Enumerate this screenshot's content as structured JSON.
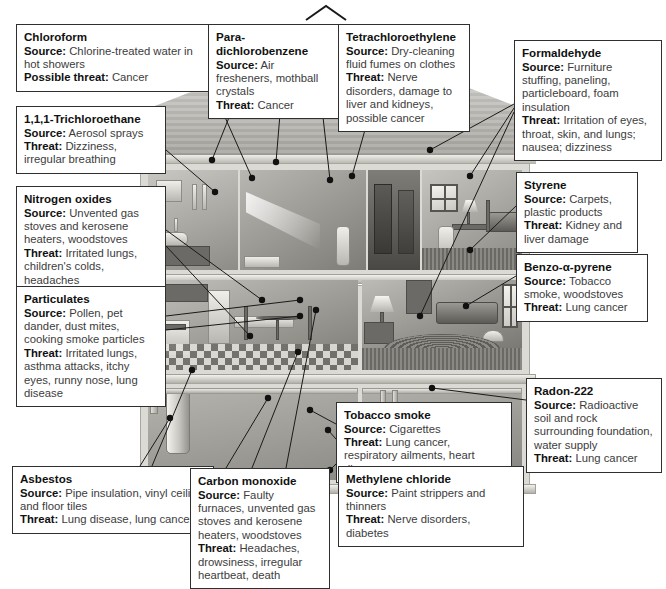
{
  "diagram": {
    "type": "cutaway-illustration",
    "labels": {
      "source": "Source:",
      "threat": "Threat:",
      "possible_threat": "Possible threat:"
    }
  },
  "pollutants": [
    {
      "id": "chloroform",
      "name": "Chloroform",
      "source_label": "Source:",
      "source": "Chlorine-treated water in hot showers",
      "threat_label": "Possible threat:",
      "threat": "Cancer"
    },
    {
      "id": "trichloroethane",
      "name": "1,1,1-Trichloroethane",
      "source_label": "Source:",
      "source": "Aerosol sprays",
      "threat_label": "Threat:",
      "threat": "Dizziness, irregular breathing"
    },
    {
      "id": "nitrogen-oxides",
      "name": "Nitrogen oxides",
      "source_label": "Source:",
      "source": "Unvented gas stoves and kerosene heaters, woodstoves",
      "threat_label": "Threat:",
      "threat": "Irritated lungs, children's colds, headaches"
    },
    {
      "id": "particulates",
      "name": "Particulates",
      "source_label": "Source:",
      "source": "Pollen, pet dander, dust mites, cooking smoke particles",
      "threat_label": "Threat:",
      "threat": "Irritated lungs, asthma attacks, itchy eyes, runny nose, lung disease"
    },
    {
      "id": "asbestos",
      "name": "Asbestos",
      "source_label": "Source:",
      "source": "Pipe insulation, vinyl ceiling and floor tiles",
      "threat_label": "Threat:",
      "threat": "Lung disease, lung cancer"
    },
    {
      "id": "para-dichlorobenzene",
      "name": "Para-dichlorobenzene",
      "source_label": "Source:",
      "source": "Air fresheners, mothball crystals",
      "threat_label": "Threat:",
      "threat": "Cancer"
    },
    {
      "id": "tetrachloroethylene",
      "name": "Tetrachloroethylene",
      "source_label": "Source:",
      "source": "Dry-cleaning fluid fumes on clothes",
      "threat_label": "Threat:",
      "threat": "Nerve disorders, damage to liver and kidneys, possible cancer"
    },
    {
      "id": "formaldehyde",
      "name": "Formaldehyde",
      "source_label": "Source:",
      "source": "Furniture stuffing, paneling, particleboard, foam insulation",
      "threat_label": "Threat:",
      "threat": "Irritation of eyes, throat, skin, and lungs; nausea; dizziness"
    },
    {
      "id": "styrene",
      "name": "Styrene",
      "source_label": "Source:",
      "source": "Carpets, plastic products",
      "threat_label": "Threat:",
      "threat": "Kidney and liver damage"
    },
    {
      "id": "benzo-a-pyrene",
      "name": "Benzo-α-pyrene",
      "source_label": "Source:",
      "source": "Tobacco smoke, woodstoves",
      "threat_label": "Threat:",
      "threat": "Lung cancer"
    },
    {
      "id": "radon-222",
      "name": "Radon-222",
      "source_label": "Source:",
      "source": "Radioactive soil and rock surrounding foundation, water supply",
      "threat_label": "Threat:",
      "threat": "Lung cancer"
    },
    {
      "id": "tobacco-smoke",
      "name": "Tobacco smoke",
      "source_label": "Source:",
      "source": "Cigarettes",
      "threat_label": "Threat:",
      "threat": "Lung cancer, respiratory ailments, heart disease"
    },
    {
      "id": "carbon-monoxide",
      "name": "Carbon monoxide",
      "source_label": "Source:",
      "source": "Faulty furnaces, unvented gas stoves and kerosene heaters, woodstoves",
      "threat_label": "Threat:",
      "threat": "Headaches, drowsiness, irregular heartbeat, death"
    },
    {
      "id": "methylene-chloride",
      "name": "Methylene chloride",
      "source_label": "Source:",
      "source": "Paint strippers and thinners",
      "threat_label": "Threat:",
      "threat": "Nerve disorders, diabetes"
    }
  ],
  "colors": {
    "box_border": "#2f2f2f",
    "box_background": "#ffffff",
    "title_text": "#111111",
    "body_text": "#3c3c3c",
    "leader_line": "#1a1a1a",
    "house_tone": "#b9b7b0"
  }
}
